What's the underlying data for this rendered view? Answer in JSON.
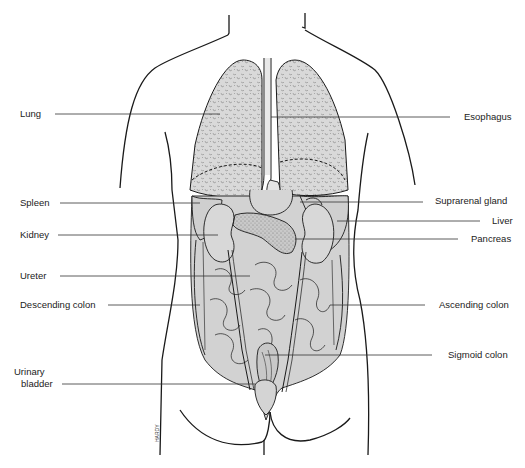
{
  "diagram": {
    "colors": {
      "organ_fill": "#d2d2d2",
      "lung_fill": "#d9d9d9",
      "outline": "#1a1a1a",
      "leader_line": "#333333",
      "background": "#ffffff"
    },
    "artist_signature": "HARDY",
    "left_labels": [
      {
        "id": "lung",
        "text": "Lung"
      },
      {
        "id": "spleen",
        "text": "Spleen"
      },
      {
        "id": "kidney",
        "text": "Kidney"
      },
      {
        "id": "ureter",
        "text": "Ureter"
      },
      {
        "id": "descending-colon",
        "text": "Descending colon"
      },
      {
        "id": "urinary-bladder-1",
        "text": "Urinary"
      },
      {
        "id": "urinary-bladder-2",
        "text": "bladder"
      }
    ],
    "right_labels": [
      {
        "id": "esophagus",
        "text": "Esophagus"
      },
      {
        "id": "suprarenal-gland",
        "text": "Suprarenal gland"
      },
      {
        "id": "liver",
        "text": "Liver"
      },
      {
        "id": "pancreas",
        "text": "Pancreas"
      },
      {
        "id": "ascending-colon",
        "text": "Ascending colon"
      },
      {
        "id": "sigmoid-colon",
        "text": "Sigmoid colon"
      }
    ]
  }
}
